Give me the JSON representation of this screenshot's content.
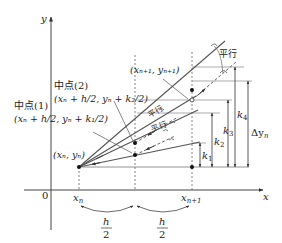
{
  "diagram": {
    "axes": {
      "y_label": "y",
      "x_label": "x",
      "origin_label": "0"
    },
    "x_ticks": {
      "xn": "x",
      "xn_sub": "n",
      "xn1": "x",
      "xn1_sub": "n+1"
    },
    "half_step": {
      "numerator": "h",
      "denominator": "2"
    },
    "points": {
      "start": "(x",
      "start_full": "(xₙ, yₙ)",
      "end_full": "(xₙ₊₁, yₙ₊₁)"
    },
    "labels": {
      "midpoint1_title": "中点(1)",
      "midpoint1_coords": "(xₙ + h/2, yₙ + k₁/2)",
      "midpoint2_title": "中点(2)",
      "midpoint2_coords": "(xₙ + h/2, yₙ + k₂/2)",
      "parallel": "平行",
      "k1": "k",
      "k1_sub": "1",
      "k2": "k",
      "k2_sub": "2",
      "k3": "k",
      "k3_sub": "3",
      "k4": "k",
      "k4_sub": "4",
      "delta_y": "Δy",
      "delta_y_sub": "n"
    },
    "colors": {
      "line": "#555555",
      "axis": "#444444",
      "dash": "#666666",
      "text": "#222222"
    }
  }
}
